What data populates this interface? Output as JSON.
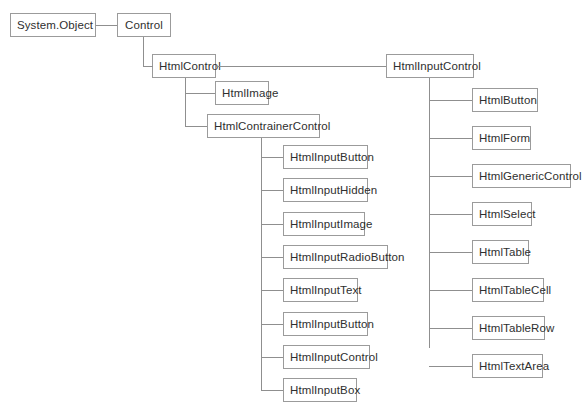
{
  "diagram": {
    "type": "class-inheritance-tree",
    "canvas": {
      "width": 587,
      "height": 417,
      "background": "#ffffff"
    },
    "style": {
      "box_border": "#9b9b9b",
      "box_fill": "#ffffff",
      "line": "#8f8f8f",
      "text": "#2f2f2f"
    },
    "nodes": {
      "system_object": {
        "label": "System.Object",
        "x": 10,
        "y": 13,
        "w": 86
      },
      "control": {
        "label": "Control",
        "x": 117,
        "y": 13,
        "w": 54
      },
      "html_control": {
        "label": "HtmlControl",
        "x": 152,
        "y": 54,
        "w": 64
      },
      "html_input_control_root": {
        "label": "HtmlInputControl",
        "x": 386,
        "y": 54,
        "w": 88
      },
      "html_image": {
        "label": "HtmlImage",
        "x": 215,
        "y": 81,
        "w": 54
      },
      "html_contrainer_control": {
        "label": "HtmlContrainerControl",
        "x": 207,
        "y": 114,
        "w": 113
      }
    },
    "left_branch": {
      "parent": "HtmlContrainerControl",
      "trunk_x": 261,
      "box_x": 283,
      "first_y": 145,
      "spacing": 33.3,
      "children": [
        {
          "label": "HtmlInputButton",
          "w": 85
        },
        {
          "label": "HtmlInputHidden",
          "w": 85
        },
        {
          "label": "HtmlInputImage",
          "w": 82
        },
        {
          "label": "HtmlInputRadioButton",
          "w": 105
        },
        {
          "label": "HtmlInputText",
          "w": 75
        },
        {
          "label": "HtmlInputButton",
          "w": 85
        },
        {
          "label": "HtmlInputControl",
          "w": 87
        },
        {
          "label": "HtmlInputBox",
          "w": 74
        }
      ]
    },
    "right_branch": {
      "parent": "HtmlInputControl",
      "trunk_x": 429,
      "box_x": 472,
      "first_y": 88,
      "spacing": 38.0,
      "children": [
        {
          "label": "HtmlButton",
          "w": 66
        },
        {
          "label": "HtmlForm",
          "w": 59
        },
        {
          "label": "HtmlGenericControl",
          "w": 99
        },
        {
          "label": "HtmlSelect",
          "w": 60
        },
        {
          "label": "HtmlTable",
          "w": 57
        },
        {
          "label": "HtmlTableCell",
          "w": 72
        },
        {
          "label": "HtmlTableRow",
          "w": 73
        },
        {
          "label": "HtmlTextArea",
          "w": 71
        }
      ]
    }
  }
}
